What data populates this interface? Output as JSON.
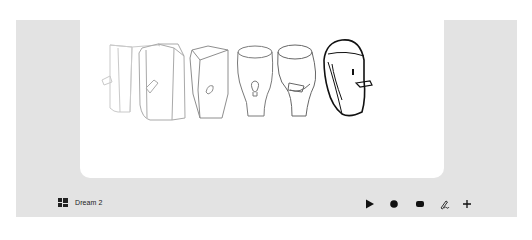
{
  "scene": {
    "icon": "layout-grid-icon",
    "name": "Dream 2"
  },
  "canvas": {
    "background": "#ffffff",
    "frames": [
      {
        "index": 1,
        "shape": "box",
        "opacity": 0.25
      },
      {
        "index": 2,
        "shape": "box",
        "opacity": 0.35
      },
      {
        "index": 3,
        "shape": "tapered-box",
        "opacity": 0.5
      },
      {
        "index": 4,
        "shape": "vase",
        "opacity": 0.6
      },
      {
        "index": 5,
        "shape": "vase-with-beak",
        "opacity": 0.7
      },
      {
        "index": 6,
        "shape": "bird-head",
        "opacity": 1.0
      }
    ]
  },
  "toolbar": {
    "tools": [
      {
        "name": "play",
        "icon": "play-icon"
      },
      {
        "name": "record",
        "icon": "record-icon"
      },
      {
        "name": "stop",
        "icon": "stop-icon"
      },
      {
        "name": "draw",
        "icon": "pen-scribble-icon"
      },
      {
        "name": "add",
        "icon": "plus-icon"
      }
    ]
  },
  "colors": {
    "panel": "#e3e3e3",
    "canvas": "#ffffff",
    "ink": "#111111"
  }
}
